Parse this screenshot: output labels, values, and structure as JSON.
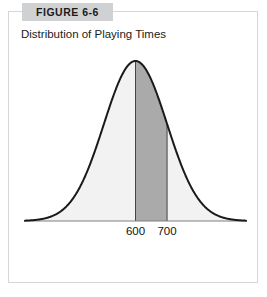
{
  "figure": {
    "badge_label": "FIGURE 6-6",
    "caption": "Distribution of Playing Times"
  },
  "colors": {
    "frame_border": "#d6d7d9",
    "badge_background": "#d0d1d3",
    "curve_stroke": "#1a1a1a",
    "area_fill_light": "#f2f2f2",
    "area_fill_shaded": "#aaaaaa",
    "baseline": "#808080",
    "divider_line": "#444444",
    "text": "#222222"
  },
  "chart_data": {
    "type": "area",
    "title": "Distribution of Playing Times",
    "xlabel": "",
    "ylabel": "",
    "distribution": "normal",
    "mean": 600,
    "std_dev": 100,
    "tick_labels": [
      "600",
      "700"
    ],
    "tick_values": [
      600,
      700
    ],
    "shaded_region": {
      "from": 600,
      "to": 700,
      "fill": "#aaaaaa",
      "description": "shaded area between 600 and 700"
    },
    "unshaded_fill": "#f2f2f2",
    "xlim": [
      250,
      950
    ],
    "ylim": [
      0,
      1
    ],
    "grid": false,
    "legend": false,
    "x": [
      250,
      275,
      300,
      325,
      350,
      375,
      400,
      425,
      450,
      475,
      500,
      525,
      550,
      575,
      600,
      625,
      650,
      675,
      700,
      725,
      750,
      775,
      800,
      825,
      850,
      875,
      900,
      925,
      950
    ],
    "y": [
      0.002,
      0.004,
      0.011,
      0.024,
      0.044,
      0.081,
      0.135,
      0.21,
      0.325,
      0.457,
      0.607,
      0.754,
      0.882,
      0.969,
      1.0,
      0.969,
      0.882,
      0.754,
      0.607,
      0.457,
      0.325,
      0.21,
      0.135,
      0.081,
      0.044,
      0.024,
      0.011,
      0.004,
      0.002
    ]
  }
}
